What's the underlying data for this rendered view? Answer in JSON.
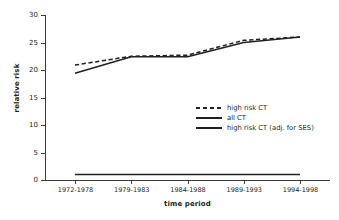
{
  "chart_data": {
    "type": "line",
    "title": "",
    "xlabel": "time period",
    "ylabel": "relative risk",
    "categories": [
      "1972-1978",
      "1979-1983",
      "1984-1988",
      "1989-1993",
      "1994-1998"
    ],
    "ylim": [
      0,
      30
    ],
    "yticks": [
      0,
      5,
      10,
      15,
      20,
      25,
      30
    ],
    "grid": false,
    "legend_position": "center-right",
    "series": [
      {
        "name": "high risk CT",
        "style": "dashed",
        "color": "#231f20",
        "values": [
          20.9,
          22.5,
          22.7,
          25.4,
          26.0
        ]
      },
      {
        "name": "all CT",
        "style": "solid",
        "color": "#231f20",
        "values": [
          1.0,
          1.0,
          1.0,
          1.0,
          1.0
        ]
      },
      {
        "name": "high risk CT (adj. for SES)",
        "style": "solid",
        "color": "#231f20",
        "values": [
          19.4,
          22.4,
          22.4,
          25.0,
          26.0
        ]
      }
    ]
  },
  "axis": {
    "y_tick_labels": [
      "0",
      "5",
      "10",
      "15",
      "20",
      "25",
      "30"
    ],
    "y_axis_title": "relative risk",
    "x_axis_title": "time period",
    "x_tick_labels": [
      "1972-1978",
      "1979-1983",
      "1984-1988",
      "1989-1993",
      "1994-1998"
    ]
  },
  "legend": {
    "items": [
      {
        "label": "high risk CT",
        "style": "dashed"
      },
      {
        "label": "all CT",
        "style": "solid"
      },
      {
        "label": "high risk CT (adj. for SES)",
        "style": "solid"
      }
    ]
  },
  "colors": {
    "ink": "#231f20",
    "axis": "#3b3b3b",
    "background": "#ffffff"
  }
}
